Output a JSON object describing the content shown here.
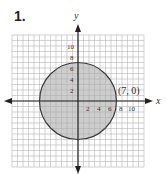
{
  "problem": {
    "number": "1."
  },
  "chart_data": {
    "type": "region",
    "title": "",
    "xlabel": "x",
    "ylabel": "y",
    "x_ticks": [
      "2",
      "4",
      "6",
      "8",
      "10"
    ],
    "y_ticks": [
      "2",
      "4",
      "6",
      "8",
      "10"
    ],
    "xlim": [
      -12,
      12
    ],
    "ylim": [
      -12,
      12
    ],
    "grid": true,
    "shape": {
      "kind": "circle",
      "center": [
        0,
        0
      ],
      "radius": 7,
      "filled": true
    },
    "annotations": [
      {
        "text": "(7, 0)",
        "point": [
          7,
          0
        ]
      }
    ],
    "colors": {
      "fill": "#c4c4c4",
      "stroke": "#333333",
      "grid": "#d8d8d8",
      "axis": "#222222"
    }
  }
}
